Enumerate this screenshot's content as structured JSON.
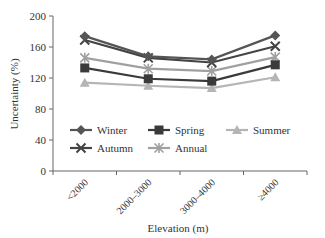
{
  "chart_data": {
    "type": "line",
    "title": "",
    "xlabel": "Elevation (m)",
    "ylabel": "Uncertainty (%)",
    "ylim": [
      0,
      200
    ],
    "yticks": [
      0,
      40,
      80,
      120,
      160,
      200
    ],
    "categories": [
      "<2000",
      "2000–3000",
      "3000–4000",
      "≥4000"
    ],
    "grid": false,
    "legend_position": "inside-bottom",
    "series": [
      {
        "name": "Winter",
        "marker": "diamond",
        "color": "#555555",
        "values": [
          174,
          148,
          144,
          175
        ]
      },
      {
        "name": "Spring",
        "marker": "square",
        "color": "#3a3a3a",
        "values": [
          133,
          119,
          116,
          137
        ]
      },
      {
        "name": "Summer",
        "marker": "triangle",
        "color": "#b5b5b5",
        "values": [
          114,
          110,
          107,
          121
        ]
      },
      {
        "name": "Autumn",
        "marker": "x",
        "color": "#444444",
        "values": [
          169,
          146,
          140,
          161
        ]
      },
      {
        "name": "Annual",
        "marker": "star",
        "color": "#a0a0a0",
        "values": [
          146,
          132,
          129,
          147
        ]
      }
    ]
  }
}
